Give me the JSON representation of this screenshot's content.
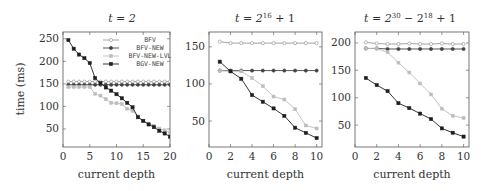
{
  "figure": {
    "ylabel": "time (ms)",
    "xlabel": "current depth"
  },
  "legend": {
    "entries": [
      {
        "label": "BFV",
        "color": "#9a9a9a",
        "marker": "circle-open",
        "dashed": false
      },
      {
        "label": "BFV-NEW",
        "color": "#444444",
        "marker": "circle",
        "dashed": false
      },
      {
        "label": "BFV-NEW-LVL",
        "color": "#bbbbbb",
        "marker": "square",
        "dashed": false
      },
      {
        "label": "BGV-NEW",
        "color": "#222222",
        "marker": "square",
        "dashed": false
      }
    ]
  },
  "chart_data": [
    {
      "type": "line",
      "title": "t = 2",
      "title_main": "t = 2",
      "xlabel": "current depth",
      "ylabel": "time (ms)",
      "xlim": [
        0,
        20
      ],
      "ylim": [
        10,
        265
      ],
      "xticks": [
        0,
        5,
        10,
        15,
        20
      ],
      "yticks": [
        50,
        100,
        150,
        200,
        250
      ],
      "grid": false,
      "legend_position": "upper right",
      "x": [
        1,
        2,
        3,
        4,
        5,
        6,
        7,
        8,
        9,
        10,
        11,
        12,
        13,
        14,
        15,
        16,
        17,
        18,
        19,
        20
      ],
      "series": [
        {
          "name": "BFV",
          "values": [
            155,
            155,
            155,
            155,
            155,
            155,
            155,
            155,
            155,
            155,
            155,
            155,
            155,
            155,
            155,
            155,
            155,
            155,
            155,
            155
          ]
        },
        {
          "name": "BFV-NEW",
          "values": [
            148,
            148,
            148,
            148,
            148,
            148,
            148,
            148,
            148,
            148,
            148,
            148,
            148,
            148,
            148,
            148,
            148,
            148,
            148,
            148
          ]
        },
        {
          "name": "BFV-NEW-LVL",
          "values": [
            143,
            143,
            143,
            143,
            143,
            128,
            124,
            116,
            108,
            107,
            105,
            95,
            90,
            78,
            68,
            62,
            57,
            51,
            47,
            42
          ]
        },
        {
          "name": "BGV-NEW",
          "values": [
            247,
            228,
            215,
            207,
            196,
            163,
            152,
            142,
            135,
            127,
            118,
            108,
            98,
            76,
            68,
            60,
            54,
            46,
            40,
            33
          ]
        }
      ]
    },
    {
      "type": "line",
      "title": "t = 2^16 + 1",
      "title_main": "t = 2",
      "title_sup": "16",
      "title_tail": " + 1",
      "xlabel": "current depth",
      "ylabel": "",
      "xlim": [
        0,
        10.5
      ],
      "ylim": [
        15,
        170
      ],
      "xticks": [
        0,
        2,
        4,
        6,
        8,
        10
      ],
      "yticks": [
        50,
        100,
        150
      ],
      "grid": false,
      "x": [
        1,
        2,
        3,
        4,
        5,
        6,
        7,
        8,
        9,
        10
      ],
      "series": [
        {
          "name": "BFV",
          "values": [
            157,
            155,
            155,
            155,
            155,
            155,
            155,
            155,
            155,
            155
          ]
        },
        {
          "name": "BFV-NEW",
          "values": [
            118,
            118,
            118,
            118,
            118,
            118,
            118,
            118,
            118,
            118
          ]
        },
        {
          "name": "BFV-NEW-LVL",
          "values": [
            118,
            117,
            117,
            108,
            97,
            83,
            79,
            66,
            44,
            40
          ]
        },
        {
          "name": "BGV-NEW",
          "values": [
            130,
            117,
            107,
            85,
            76,
            67,
            57,
            41,
            34,
            27
          ]
        }
      ]
    },
    {
      "type": "line",
      "title": "t = 2^30 - 2^18 + 1",
      "title_main": "t = 2",
      "title_sup": "30",
      "title_mid": " − 2",
      "title_sup2": "18",
      "title_tail": " + 1",
      "xlabel": "current depth",
      "ylabel": "",
      "xlim": [
        0,
        10.5
      ],
      "ylim": [
        10,
        220
      ],
      "xticks": [
        0,
        2,
        4,
        6,
        8,
        10
      ],
      "yticks": [
        50,
        100,
        150,
        200
      ],
      "grid": false,
      "x": [
        1,
        2,
        3,
        4,
        5,
        6,
        7,
        8,
        9,
        10
      ],
      "series": [
        {
          "name": "BFV",
          "values": [
            201,
            199,
            198,
            198,
            199,
            198,
            198,
            199,
            198,
            198
          ]
        },
        {
          "name": "BFV-NEW",
          "values": [
            190,
            190,
            189,
            189,
            189,
            189,
            189,
            189,
            189,
            189
          ]
        },
        {
          "name": "BFV-NEW-LVL",
          "values": [
            190,
            190,
            183,
            164,
            146,
            126,
            106,
            80,
            67,
            63
          ]
        },
        {
          "name": "BGV-NEW",
          "values": [
            136,
            123,
            112,
            90,
            81,
            71,
            61,
            44,
            36,
            29
          ]
        }
      ]
    }
  ]
}
